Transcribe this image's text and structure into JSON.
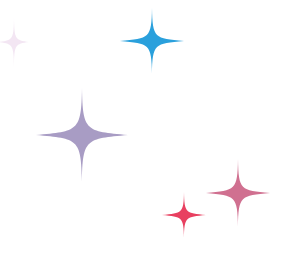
{
  "canvas": {
    "width": 294,
    "height": 264,
    "background": "#ffffff"
  },
  "sparkles": [
    {
      "name": "faint-pink-sparkle",
      "cx": 14,
      "cy": 42,
      "w": 30,
      "h": 52,
      "color": "#eedcee",
      "opacity": 0.7
    },
    {
      "name": "blue-sparkle",
      "cx": 152,
      "cy": 41,
      "w": 64,
      "h": 66,
      "color": "#2aa0dc",
      "opacity": 1
    },
    {
      "name": "purple-sparkle",
      "cx": 82,
      "cy": 135,
      "w": 92,
      "h": 94,
      "color": "#a89cc4",
      "opacity": 1
    },
    {
      "name": "mauve-sparkle",
      "cx": 238,
      "cy": 193,
      "w": 64,
      "h": 68,
      "color": "#d07090",
      "opacity": 1
    },
    {
      "name": "red-sparkle",
      "cx": 184,
      "cy": 215,
      "w": 44,
      "h": 46,
      "color": "#e84060",
      "opacity": 1
    }
  ]
}
